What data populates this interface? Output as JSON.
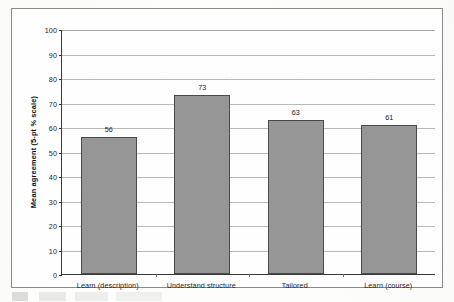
{
  "chart_data": {
    "type": "bar",
    "title": "",
    "xlabel": "",
    "ylabel": "Mean agreement (5-pt % scale)",
    "categories": [
      "Learn (description)",
      "Understand structure",
      "Tailored",
      "Learn (course)"
    ],
    "values": [
      56,
      73,
      63,
      61
    ],
    "data_labels": [
      "56",
      "73",
      "63",
      "61"
    ],
    "ylim": [
      0,
      100
    ],
    "ytick_step": 10,
    "yticks": [
      "100",
      "90",
      "80",
      "70",
      "60",
      "50",
      "40",
      "30",
      "20",
      "10",
      "0"
    ],
    "grid": "horizontal",
    "legend": "none",
    "bar_fill": "#969696",
    "bar_border": "#4a4a4a",
    "axis_color": "#3a3a3a",
    "gridline_color": "#b9b9b9",
    "frame_border": "#8a8a8a",
    "background": "#fefefe"
  }
}
